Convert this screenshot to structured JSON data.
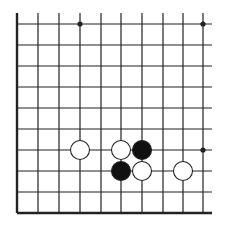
{
  "board": {
    "description": "Go board diagram, lower-left corner region",
    "colors": {
      "background": "#ffffff",
      "line": "#222222",
      "black_stone": "#111111",
      "white_stone": "#ffffff",
      "stone_outline": "#222222"
    },
    "columns_x": [
      17,
      38,
      59,
      80,
      101,
      121,
      142,
      163,
      183,
      203
    ],
    "rows_y": [
      24,
      45,
      66,
      87,
      108,
      129,
      150,
      171,
      192,
      213
    ],
    "line_extent": {
      "top": 13,
      "right": 212
    },
    "edges": {
      "left": true,
      "bottom": true,
      "top": false,
      "right": false
    },
    "star_points": [
      {
        "col": 3,
        "row": 0
      },
      {
        "col": 9,
        "row": 0
      },
      {
        "col": 9,
        "row": 6
      }
    ],
    "stones": [
      {
        "color": "white",
        "col": 3,
        "row": 6
      },
      {
        "color": "white",
        "col": 5,
        "row": 6
      },
      {
        "color": "black",
        "col": 6,
        "row": 6
      },
      {
        "color": "black",
        "col": 5,
        "row": 7
      },
      {
        "color": "white",
        "col": 6,
        "row": 7
      },
      {
        "color": "white",
        "col": 8,
        "row": 7
      }
    ],
    "stone_radius": 9.5
  }
}
